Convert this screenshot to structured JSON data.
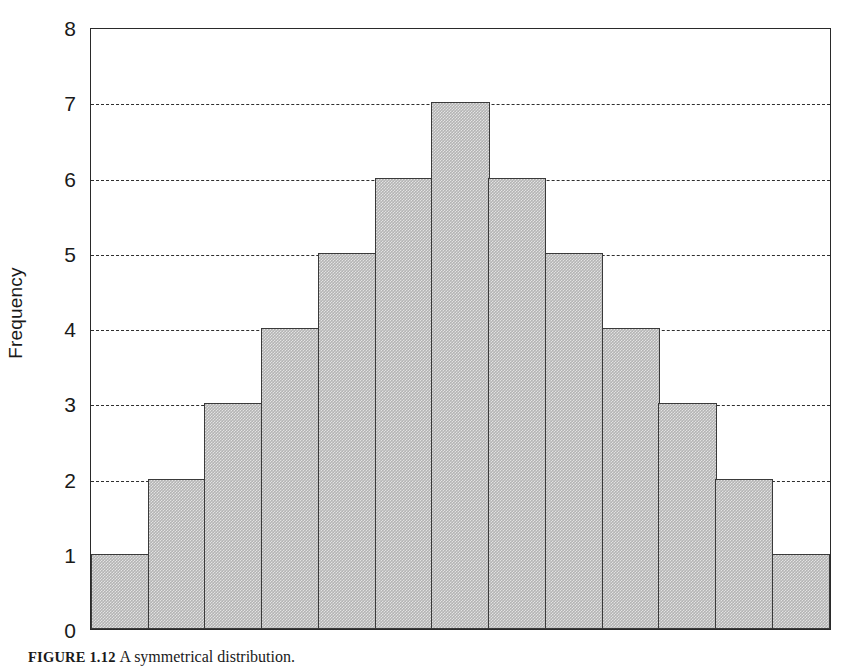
{
  "figure": {
    "caption_number": "FIGURE 1.12",
    "caption_text": "A symmetrical distribution."
  },
  "chart_data": {
    "type": "bar",
    "title": "",
    "subtitle": "",
    "xlabel": "",
    "ylabel": "Frequency",
    "categories": [
      "1",
      "2",
      "3",
      "4",
      "5",
      "6",
      "7",
      "8",
      "9",
      "10",
      "11",
      "12",
      "13"
    ],
    "values": [
      1,
      2,
      3,
      4,
      5,
      6,
      7,
      6,
      5,
      4,
      3,
      2,
      1
    ],
    "ylim": [
      0,
      8
    ],
    "xlim": [
      0,
      13
    ],
    "y_ticks": [
      0,
      1,
      2,
      3,
      4,
      5,
      6,
      7,
      8
    ],
    "y_tick_labels": [
      "0",
      "1",
      "2",
      "3",
      "4",
      "5",
      "6",
      "7",
      "8"
    ],
    "x_tick_labels": [],
    "gridlines": {
      "horizontal": [
        1,
        2,
        3,
        4,
        5,
        6,
        7
      ],
      "vertical": [],
      "style": "dashed"
    },
    "legend": null,
    "legend_position": "none",
    "annotations": [],
    "colors": {
      "bar_fill": "#b4b4b4",
      "bar_edge": "#3a3a3a",
      "grid": "#2f2f2f",
      "axis": "#2a2a2a",
      "background": "#ffffff",
      "text": "#1a1a1a"
    }
  }
}
